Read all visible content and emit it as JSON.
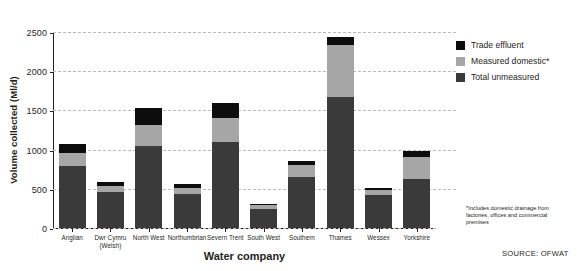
{
  "chart_data": {
    "type": "bar",
    "title": "",
    "xlabel": "Water company",
    "ylabel": "Volume collected (Ml/d)",
    "ylim": [
      0,
      2500
    ],
    "yticks": [
      0,
      500,
      1000,
      1500,
      2000,
      2500
    ],
    "ytick_labels": [
      "0",
      "500",
      "1000",
      "1500",
      "2000",
      "2500"
    ],
    "grid": true,
    "stacked": true,
    "legend_position": "right",
    "categories": [
      "Anglian",
      "Dwr Cymru (Welsh)",
      "North West",
      "Northumbrian",
      "Severn Trent",
      "South West",
      "Southern",
      "Thames",
      "Wessex",
      "Yorkshire"
    ],
    "category_lines": [
      [
        "Anglian"
      ],
      [
        "Dwr Cymru",
        "(Welsh)"
      ],
      [
        "North West"
      ],
      [
        "Northumbrian"
      ],
      [
        "Severn Trent"
      ],
      [
        "South West"
      ],
      [
        "Southern"
      ],
      [
        "Thames"
      ],
      [
        "Wessex"
      ],
      [
        "Yorkshire"
      ]
    ],
    "series": [
      {
        "name": "Total unmeasured",
        "color": "#3a3a3a",
        "values": [
          790,
          460,
          1050,
          440,
          1100,
          240,
          650,
          1670,
          420,
          630
        ]
      },
      {
        "name": "Measured domestic*",
        "color": "#a6a6a6",
        "values": [
          170,
          80,
          260,
          70,
          300,
          50,
          160,
          660,
          60,
          280
        ]
      },
      {
        "name": "Trade effluent",
        "color": "#0d0d0d",
        "values": [
          110,
          50,
          220,
          50,
          190,
          20,
          40,
          110,
          30,
          70
        ]
      }
    ],
    "totals": [
      1070,
      590,
      1530,
      560,
      1590,
      310,
      850,
      2440,
      510,
      980
    ]
  },
  "legend": {
    "items": [
      {
        "label": "Trade effluent",
        "color": "#0d0d0d"
      },
      {
        "label": "Measured domestic*",
        "color": "#a6a6a6"
      },
      {
        "label": "Total unmeasured",
        "color": "#3a3a3a"
      }
    ]
  },
  "footnote": "*Includes domestic drainage from factories, offices and commercial premises",
  "source": "SOURCE: OFWAT"
}
